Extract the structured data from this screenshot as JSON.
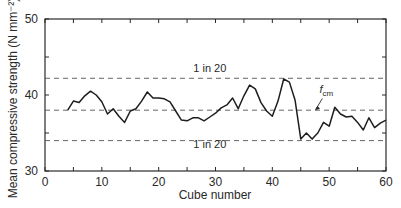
{
  "chart_data": {
    "type": "line",
    "title": "",
    "xlabel": "Cube number",
    "ylabel": "Mean compressive strength (N mm⁻²)",
    "xlim": [
      0,
      60
    ],
    "ylim": [
      30,
      50
    ],
    "x_ticks": [
      0,
      10,
      20,
      30,
      40,
      50,
      60
    ],
    "x_minor_ticks": [
      5,
      15,
      25,
      35,
      45,
      55
    ],
    "y_ticks": [
      30,
      40,
      50
    ],
    "y_minor_ticks": [
      35,
      45
    ],
    "grid": false,
    "reference_lines": [
      {
        "name": "upper-limit",
        "y": 42.2,
        "label": "1 in 20",
        "style": "dashed"
      },
      {
        "name": "fcm",
        "y": 38.0,
        "label": "f_cm",
        "style": "dashed"
      },
      {
        "name": "lower-limit",
        "y": 34.0,
        "label": "1 in 20",
        "style": "dashed"
      }
    ],
    "annotations": [
      {
        "text": "1 in 20",
        "x": 29,
        "y": 43.0,
        "target": "upper-limit"
      },
      {
        "text": "1 in 20",
        "x": 29,
        "y": 33.0,
        "target": "lower-limit"
      },
      {
        "text": "f",
        "subscript": "cm",
        "x": 49.5,
        "y": 40.2,
        "arrow_to": [
          47.5,
          38.0
        ]
      }
    ],
    "series": [
      {
        "name": "Running mean strength",
        "x": [
          4,
          5,
          6,
          7,
          8,
          9,
          10,
          11,
          12,
          13,
          14,
          15,
          16,
          17,
          18,
          19,
          20,
          21,
          22,
          23,
          24,
          25,
          26,
          27,
          28,
          29,
          30,
          31,
          32,
          33,
          34,
          35,
          36,
          37,
          38,
          39,
          40,
          41,
          42,
          43,
          44,
          45,
          46,
          47,
          48,
          49,
          50,
          51,
          52,
          53,
          54,
          55,
          56,
          57,
          58,
          59,
          60
        ],
        "values": [
          38.0,
          39.2,
          39.0,
          39.9,
          40.5,
          40.0,
          39.1,
          37.5,
          38.2,
          37.2,
          36.4,
          37.9,
          38.2,
          39.2,
          40.4,
          39.6,
          39.6,
          39.5,
          39.1,
          37.9,
          36.7,
          36.6,
          37.0,
          37.0,
          36.6,
          37.1,
          37.6,
          38.3,
          38.7,
          39.6,
          38.2,
          39.9,
          41.3,
          40.8,
          39.0,
          37.9,
          37.2,
          39.2,
          42.1,
          41.7,
          39.3,
          34.2,
          35.0,
          34.2,
          35.0,
          36.4,
          35.9,
          38.4,
          37.5,
          37.1,
          37.2,
          36.4,
          35.4,
          37.0,
          35.7,
          36.3,
          36.7
        ]
      }
    ]
  }
}
